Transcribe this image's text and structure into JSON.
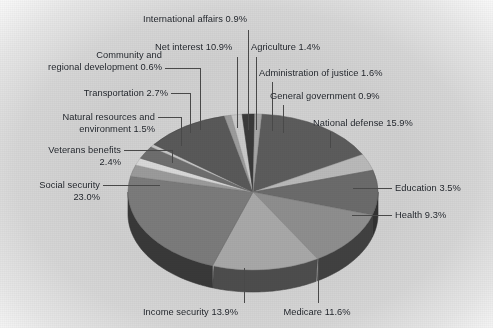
{
  "figure": {
    "kind": "3d-pie-chart",
    "background_color": "#d4d4d4",
    "label_color": "#20242a",
    "leader_line_color": "#4a4a4a"
  },
  "chart_data": {
    "type": "pie",
    "title": "",
    "subtitle": "",
    "xlabel": "",
    "ylabel": "",
    "legend_position": "none",
    "grid": false,
    "three_d": true,
    "start_angle_deg": -86,
    "direction": "clockwise",
    "units": "percent",
    "total": 100.1,
    "categories": [
      "National defense",
      "Education",
      "Health",
      "Medicare",
      "Income security",
      "Social security",
      "Veterans benefits",
      "Natural resources and environment",
      "Transportation",
      "Community and regional development",
      "Net interest",
      "International affairs",
      "Agriculture",
      "Administration of justice",
      "General government"
    ],
    "values": [
      15.9,
      3.5,
      9.3,
      11.6,
      13.9,
      23.0,
      2.4,
      1.5,
      2.7,
      0.6,
      10.9,
      0.9,
      1.4,
      1.6,
      0.9
    ],
    "slices": [
      {
        "name": "National defense",
        "value": 15.9,
        "label": "National defense 15.9%",
        "color": "#5c5c5c"
      },
      {
        "name": "Education",
        "value": 3.5,
        "label": "Education 3.5%",
        "color": "#b9b9b9"
      },
      {
        "name": "Health",
        "value": 9.3,
        "label": "Health 9.3%",
        "color": "#6b6b6b"
      },
      {
        "name": "Medicare",
        "value": 11.6,
        "label": "Medicare 11.6%",
        "color": "#8e8e8e"
      },
      {
        "name": "Income security",
        "value": 13.9,
        "label": "Income security 13.9%",
        "color": "#a8a8a8"
      },
      {
        "name": "Social security",
        "value": 23.0,
        "label": "Social security\n23.0%",
        "color": "#7b7b7b"
      },
      {
        "name": "Veterans benefits",
        "value": 2.4,
        "label": "Veterans benefits\n2.4%",
        "color": "#9b9b9b"
      },
      {
        "name": "Natural resources and environment",
        "value": 1.5,
        "label": "Natural resources and\nenvironment 1.5%",
        "color": "#d8d8d8"
      },
      {
        "name": "Transportation",
        "value": 2.7,
        "label": "Transportation 2.7%",
        "color": "#6e6e6e"
      },
      {
        "name": "Community and regional development",
        "value": 0.6,
        "label": "Community and\nregional development 0.6%",
        "color": "#c6c6c6"
      },
      {
        "name": "Net interest",
        "value": 10.9,
        "label": "Net interest 10.9%",
        "color": "#595959"
      },
      {
        "name": "International affairs",
        "value": 0.9,
        "label": "International affairs 0.9%",
        "color": "#9c9c9c"
      },
      {
        "name": "Agriculture",
        "value": 1.4,
        "label": "Agriculture 1.4%",
        "color": "#c9c9c9"
      },
      {
        "name": "Administration of justice",
        "value": 1.6,
        "label": "Administration of justice 1.6%",
        "color": "#3a3a3a"
      },
      {
        "name": "General government",
        "value": 0.9,
        "label": "General government 0.9%",
        "color": "#a6a6a6"
      }
    ]
  },
  "labels": {
    "international_affairs": "International affairs 0.9%",
    "net_interest": "Net interest 10.9%",
    "agriculture": "Agriculture 1.4%",
    "community_regional_development_l1": "Community and",
    "community_regional_development_l2": "regional development 0.6%",
    "administration_of_justice": "Administration of justice 1.6%",
    "transportation": "Transportation 2.7%",
    "general_government": "General government 0.9%",
    "natural_resources_l1": "Natural resources and",
    "natural_resources_l2": "environment 1.5%",
    "national_defense": "National defense 15.9%",
    "veterans_benefits_l1": "Veterans benefits",
    "veterans_benefits_l2": "2.4%",
    "social_security_l1": "Social security",
    "social_security_l2": "23.0%",
    "education": "Education 3.5%",
    "health": "Health 9.3%",
    "income_security": "Income security 13.9%",
    "medicare": "Medicare 11.6%"
  }
}
